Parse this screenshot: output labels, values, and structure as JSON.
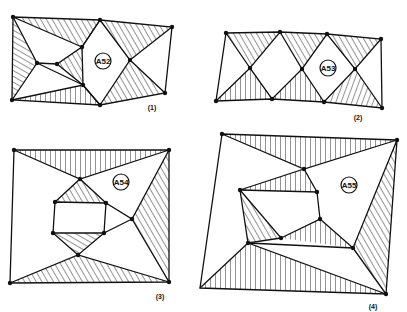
{
  "figures": [
    {
      "id": "fig1",
      "caption": "(1)",
      "region_label": "A52"
    },
    {
      "id": "fig2",
      "caption": "(2)",
      "region_label": "A53"
    },
    {
      "id": "fig3",
      "caption": "(3)",
      "region_label": "A54"
    },
    {
      "id": "fig4",
      "caption": "(4)",
      "region_label": "A55"
    }
  ],
  "colors": {
    "ink": "#111111",
    "paper": "#ffffff"
  }
}
